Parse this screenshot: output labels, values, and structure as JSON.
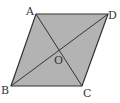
{
  "figure": {
    "shape": "parallelogram",
    "fill_color": "#b3b3b3",
    "stroke_color": "#333333",
    "vertices": {
      "A": {
        "label": "A",
        "x": 36,
        "y": 14
      },
      "D": {
        "label": "D",
        "x": 108,
        "y": 14
      },
      "C": {
        "label": "C",
        "x": 82,
        "y": 86
      },
      "B": {
        "label": "B",
        "x": 11,
        "y": 86
      }
    },
    "intersection": {
      "label": "O",
      "x": 59,
      "y": 50
    },
    "diagonals": [
      "AC",
      "BD"
    ]
  }
}
